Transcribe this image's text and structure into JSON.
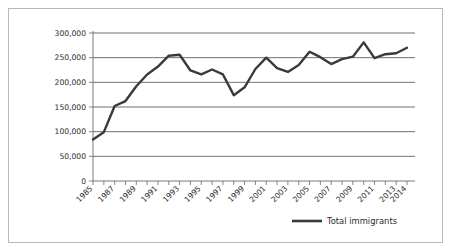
{
  "figure": {
    "frame_color": "#b9b9b9",
    "background": "#ffffff"
  },
  "legend": {
    "position": "bottom-right",
    "entries": [
      {
        "label": "Total immigrants",
        "color": "#3a3a3a"
      }
    ]
  },
  "chart_data": {
    "type": "line",
    "title": "",
    "subtitle": "",
    "xlabel": "",
    "ylabel": "",
    "grid": true,
    "legend_position": "bottom-right",
    "ylim": [
      0,
      300000
    ],
    "xlim": [
      1985,
      2014
    ],
    "ytick_labels": [
      "0",
      "50,000",
      "100,000",
      "150,000",
      "200,000",
      "250,000",
      "300,000"
    ],
    "ytick_values": [
      0,
      50000,
      100000,
      150000,
      200000,
      250000,
      300000
    ],
    "xtick_labels": [
      "1985",
      "1987",
      "1989",
      "1991",
      "1993",
      "1995",
      "1997",
      "1999",
      "2001",
      "2003",
      "2005",
      "2007",
      "2009",
      "2011",
      "2013",
      "2014"
    ],
    "xtick_values": [
      1985,
      1987,
      1989,
      1991,
      1993,
      1995,
      1997,
      1999,
      2001,
      2003,
      2005,
      2007,
      2009,
      2011,
      2013,
      2014
    ],
    "x": [
      1985,
      1986,
      1987,
      1988,
      1989,
      1990,
      1991,
      1992,
      1993,
      1994,
      1995,
      1996,
      1997,
      1998,
      1999,
      2000,
      2001,
      2002,
      2003,
      2004,
      2005,
      2006,
      2007,
      2008,
      2009,
      2010,
      2011,
      2012,
      2013,
      2014
    ],
    "series": [
      {
        "name": "Total immigrants",
        "color": "#3a3a3a",
        "values": [
          84000,
          99000,
          152000,
          162000,
          192000,
          216000,
          232000,
          254000,
          256000,
          224000,
          216000,
          226000,
          216000,
          174000,
          190000,
          227000,
          250000,
          229000,
          221000,
          235000,
          262000,
          251000,
          237000,
          247000,
          252000,
          281000,
          249000,
          257000,
          259000,
          270000
        ]
      }
    ]
  }
}
